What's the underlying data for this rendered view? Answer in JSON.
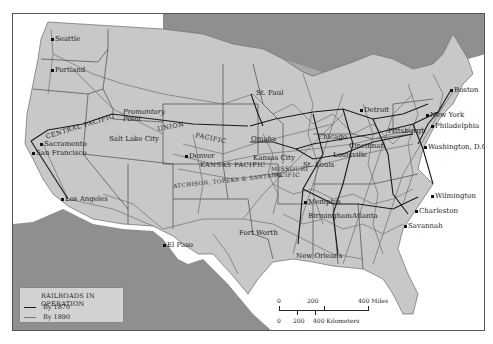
{
  "map": {
    "title": "Railroads in Operation, United States",
    "colors": {
      "background": "#ffffff",
      "us_land": "#c8c8c8",
      "foreign_land": "#8f8f8f",
      "rail_1870": "#1a1a1a",
      "rail_1890": "#6e6e6e",
      "border": "#555555"
    },
    "cities": [
      {
        "name": "Seattle",
        "x": 50,
        "y": 27
      },
      {
        "name": "Portland",
        "x": 40,
        "y": 53
      },
      {
        "name": "Sacramento",
        "x": 29,
        "y": 129
      },
      {
        "name": "San Francisco",
        "x": 20,
        "y": 137
      },
      {
        "name": "Los Angeles",
        "x": 49,
        "y": 185
      },
      {
        "name": "Promontory Point",
        "x": 111,
        "y": 113
      },
      {
        "name": "Salt Lake City",
        "x": 98,
        "y": 131
      },
      {
        "name": "Denver",
        "x": 173,
        "y": 140
      },
      {
        "name": "El Paso",
        "x": 151,
        "y": 229
      },
      {
        "name": "Fort Worth",
        "x": 231,
        "y": 218
      },
      {
        "name": "Omaha",
        "x": 247,
        "y": 123
      },
      {
        "name": "Kansas City",
        "x": 249,
        "y": 141
      },
      {
        "name": "St. Paul",
        "x": 247,
        "y": 79
      },
      {
        "name": "Chicago",
        "x": 312,
        "y": 111
      },
      {
        "name": "Detroit",
        "x": 347,
        "y": 93
      },
      {
        "name": "St. Louis",
        "x": 295,
        "y": 148
      },
      {
        "name": "Louisville",
        "x": 323,
        "y": 140
      },
      {
        "name": "Cincinnati",
        "x": 340,
        "y": 130
      },
      {
        "name": "Memphis",
        "x": 292,
        "y": 187
      },
      {
        "name": "Birmingham",
        "x": 300,
        "y": 201
      },
      {
        "name": "Atlanta",
        "x": 339,
        "y": 200
      },
      {
        "name": "New Orleans",
        "x": 288,
        "y": 240
      },
      {
        "name": "Pittsburgh",
        "x": 380,
        "y": 117
      },
      {
        "name": "Boston",
        "x": 438,
        "y": 78
      },
      {
        "name": "New York",
        "x": 415,
        "y": 100
      },
      {
        "name": "Philadelphia",
        "x": 421,
        "y": 111
      },
      {
        "name": "Washington, D.C.",
        "x": 411,
        "y": 132
      },
      {
        "name": "Wilmington",
        "x": 419,
        "y": 180
      },
      {
        "name": "Charleston",
        "x": 404,
        "y": 196
      },
      {
        "name": "Savannah",
        "x": 392,
        "y": 210
      }
    ],
    "railroad_names": [
      {
        "name": "CENTRAL PACIFIC",
        "x": 32,
        "y": 123,
        "rotate": -17
      },
      {
        "name": "UNION",
        "x": 144,
        "y": 114,
        "rotate": -10
      },
      {
        "name": "PACIFIC",
        "x": 183,
        "y": 120,
        "rotate": 12
      },
      {
        "name": "KANSAS PACIFIC",
        "x": 187,
        "y": 150,
        "rotate": 0
      },
      {
        "name": "ATCHISON, TOPEKA & SANTA FE",
        "x": 192,
        "y": 162,
        "rotate": -6
      },
      {
        "name": "MISSOURI PACIFIC",
        "x": 258,
        "y": 155,
        "rotate": 0
      }
    ],
    "legend": {
      "title": "RAILROADS IN OPERATION",
      "items": [
        {
          "label": "By 1870",
          "color": "#1a1a1a",
          "width": 1.5
        },
        {
          "label": "By 1890",
          "color": "#7a7a7a",
          "width": 1
        }
      ]
    },
    "scale": {
      "miles_labels": [
        "0",
        "200",
        "400 Miles"
      ],
      "km_labels": [
        "0",
        "200",
        "400 Kilometers"
      ]
    }
  }
}
